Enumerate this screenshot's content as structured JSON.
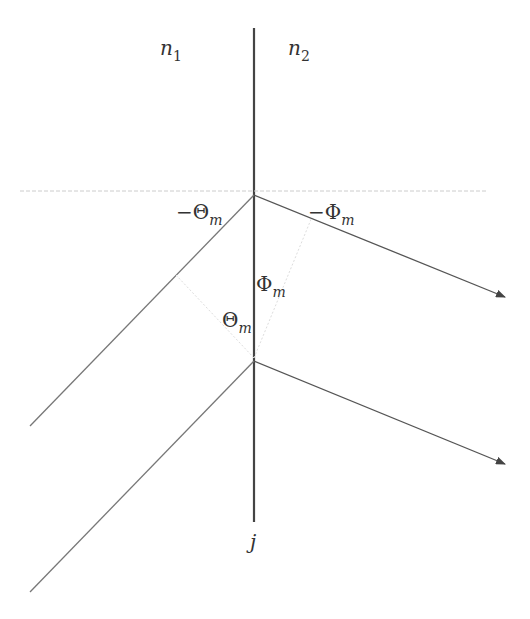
{
  "diagram": {
    "labels": {
      "n1": {
        "base": "n",
        "sub": "1"
      },
      "n2": {
        "base": "n",
        "sub": "2"
      },
      "neg_theta": {
        "base": "−Θ",
        "sub": "m"
      },
      "neg_phi": {
        "base": "−Φ",
        "sub": "m"
      },
      "phi": {
        "base": "Φ",
        "sub": "m"
      },
      "theta": {
        "base": "Θ",
        "sub": "m"
      },
      "j": "j"
    },
    "colors": {
      "line": "#444444",
      "ray": "#555555",
      "guide": "#cccccc"
    }
  }
}
